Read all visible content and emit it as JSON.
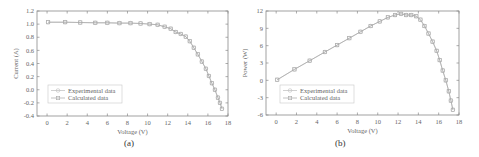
{
  "colors": {
    "axis": "#8a8a8a",
    "text": "#666666",
    "experimental": "#bdbdbd",
    "calculated": "#a8a8a8",
    "background": "#ffffff"
  },
  "chart_data": [
    {
      "id": "a",
      "type": "line",
      "panel_label": "(a)",
      "title": "",
      "xlabel": "Voltage (V)",
      "ylabel": "Current (A)",
      "xlim": [
        -1,
        18
      ],
      "ylim": [
        -0.4,
        1.2
      ],
      "xticks": [
        0,
        2,
        4,
        6,
        8,
        10,
        12,
        14,
        16,
        18
      ],
      "yticks": [
        -0.4,
        -0.2,
        0.0,
        0.2,
        0.4,
        0.6,
        0.8,
        1.0,
        1.2
      ],
      "ytick_labels": [
        "-0.4",
        "-0.2",
        "0.0",
        "0.2",
        "0.4",
        "0.6",
        "0.8",
        "1.0",
        "1.2"
      ],
      "grid": false,
      "legend": {
        "position": "lower left",
        "entries": [
          "Experimental data",
          "Calculated data"
        ]
      },
      "series": [
        {
          "name": "Experimental data",
          "marker": "circle",
          "x": [
            0.1,
            1.8,
            3.3,
            4.8,
            6.0,
            7.2,
            8.3,
            9.3,
            10.2,
            11.0,
            11.7,
            12.3,
            12.8,
            13.3,
            13.8,
            14.2,
            14.6,
            15.0,
            15.4,
            15.8,
            16.1,
            16.4,
            16.7,
            17.0,
            17.2,
            17.4
          ],
          "y": [
            1.03,
            1.03,
            1.025,
            1.02,
            1.02,
            1.015,
            1.015,
            1.01,
            1.0,
            0.99,
            0.96,
            0.93,
            0.88,
            0.85,
            0.81,
            0.74,
            0.64,
            0.54,
            0.43,
            0.32,
            0.21,
            0.1,
            0.0,
            -0.12,
            -0.2,
            -0.29
          ]
        },
        {
          "name": "Calculated data",
          "marker": "square",
          "x": [
            0.1,
            1.8,
            3.3,
            4.8,
            6.0,
            7.2,
            8.3,
            9.3,
            10.2,
            11.0,
            11.7,
            12.3,
            12.8,
            13.3,
            13.8,
            14.2,
            14.6,
            15.0,
            15.4,
            15.8,
            16.1,
            16.4,
            16.7,
            17.0,
            17.2,
            17.4
          ],
          "y": [
            1.03,
            1.03,
            1.025,
            1.02,
            1.02,
            1.015,
            1.015,
            1.01,
            1.0,
            0.99,
            0.96,
            0.93,
            0.88,
            0.85,
            0.81,
            0.74,
            0.64,
            0.54,
            0.43,
            0.32,
            0.21,
            0.1,
            0.0,
            -0.12,
            -0.2,
            -0.29
          ]
        }
      ]
    },
    {
      "id": "b",
      "type": "line",
      "panel_label": "(b)",
      "title": "",
      "xlabel": "Voltage (V)",
      "ylabel": "Power (W)",
      "xlim": [
        -1,
        18
      ],
      "ylim": [
        -6,
        12
      ],
      "xticks": [
        0,
        2,
        4,
        6,
        8,
        10,
        12,
        14,
        16,
        18
      ],
      "yticks": [
        -6,
        -3,
        0,
        3,
        6,
        9,
        12
      ],
      "ytick_labels": [
        "-6",
        "-3",
        "0",
        "3",
        "6",
        "9",
        "12"
      ],
      "grid": false,
      "legend": {
        "position": "lower left",
        "entries": [
          "Experimental data",
          "Calculated data"
        ]
      },
      "series": [
        {
          "name": "Experimental data",
          "marker": "circle",
          "x": [
            0.1,
            1.8,
            3.3,
            4.8,
            6.0,
            7.2,
            8.3,
            9.3,
            10.2,
            11.0,
            11.7,
            12.3,
            12.8,
            13.3,
            13.8,
            14.2,
            14.6,
            15.0,
            15.4,
            15.8,
            16.1,
            16.4,
            16.7,
            17.0,
            17.2,
            17.4
          ],
          "y": [
            0.1,
            1.9,
            3.4,
            4.9,
            6.1,
            7.3,
            8.4,
            9.4,
            10.2,
            10.9,
            11.3,
            11.5,
            11.3,
            11.3,
            11.1,
            10.5,
            9.4,
            8.1,
            6.7,
            5.1,
            3.5,
            1.7,
            0.0,
            -1.9,
            -3.5,
            -5.1
          ]
        },
        {
          "name": "Calculated data",
          "marker": "square",
          "x": [
            0.1,
            1.8,
            3.3,
            4.8,
            6.0,
            7.2,
            8.3,
            9.3,
            10.2,
            11.0,
            11.7,
            12.3,
            12.8,
            13.3,
            13.8,
            14.2,
            14.6,
            15.0,
            15.4,
            15.8,
            16.1,
            16.4,
            16.7,
            17.0,
            17.2,
            17.4
          ],
          "y": [
            0.1,
            1.9,
            3.4,
            4.9,
            6.1,
            7.3,
            8.4,
            9.4,
            10.2,
            10.9,
            11.3,
            11.5,
            11.3,
            11.3,
            11.1,
            10.5,
            9.4,
            8.1,
            6.7,
            5.1,
            3.5,
            1.7,
            0.0,
            -1.9,
            -3.5,
            -5.1
          ]
        }
      ]
    }
  ]
}
